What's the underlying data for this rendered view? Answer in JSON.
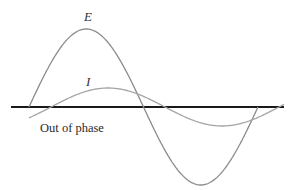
{
  "figure": {
    "caption": "Out of phase",
    "curve_labels": {
      "voltage": "E",
      "current": "I"
    },
    "colors": {
      "axis": "#1a1a1a",
      "voltage_curve": "#8c8c8c",
      "current_curve": "#a6a6a6",
      "text": "#333333",
      "background": "#ffffff"
    }
  },
  "chart_data": {
    "type": "line",
    "title": "",
    "annotation": "Out of phase",
    "xlabel": "",
    "ylabel": "",
    "grid": false,
    "legend": "none (inline labels E and I)",
    "x_units": "pixels along horizontal axis (axis from x=11 to x=284, baseline y=107)",
    "series": [
      {
        "name": "E",
        "description": "Voltage sine wave, large amplitude",
        "start_x": 29,
        "end_x": 258,
        "period_px": 229,
        "amplitude_px": 78,
        "points": [
          [
            29,
            0
          ],
          [
            90,
            78
          ],
          [
            147,
            0
          ],
          [
            203,
            -74
          ],
          [
            258,
            0
          ]
        ]
      },
      {
        "name": "I",
        "description": "Current sine wave, small amplitude, phase-shifted (lagging) relative to E",
        "start_x": 29,
        "end_x": 284,
        "period_px": 228,
        "amplitude_px": 19,
        "phase_shift_px": 22,
        "points": [
          [
            29,
            -11
          ],
          [
            51,
            0
          ],
          [
            116,
            19
          ],
          [
            165,
            0
          ],
          [
            223,
            -18
          ],
          [
            284,
            0
          ]
        ]
      }
    ]
  }
}
